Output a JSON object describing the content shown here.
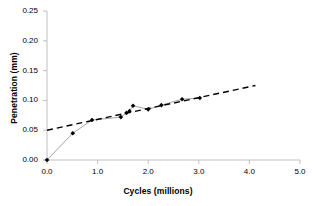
{
  "chart_data": {
    "type": "scatter",
    "title": "",
    "xlabel": "Cycles (millions)",
    "ylabel": "Penetration (mm)",
    "xlim": [
      0.0,
      5.0
    ],
    "ylim": [
      0.0,
      0.25
    ],
    "xticks": [
      "0.0",
      "1.0",
      "2.0",
      "3.0",
      "4.0",
      "5.0"
    ],
    "xtick_values": [
      0.0,
      1.0,
      2.0,
      3.0,
      4.0,
      5.0
    ],
    "yticks": [
      "0.00",
      "0.05",
      "0.10",
      "0.15",
      "0.20",
      "0.25"
    ],
    "ytick_values": [
      0.0,
      0.05,
      0.1,
      0.15,
      0.2,
      0.25
    ],
    "grid": false,
    "legend": "none",
    "series": [
      {
        "name": "Penetration measurements",
        "style": "markers-with-connecting-line",
        "marker": "filled-diamond",
        "color": "#000000",
        "points": [
          {
            "x": 0.0,
            "y": 0.0
          },
          {
            "x": 0.51,
            "y": 0.045
          },
          {
            "x": 0.89,
            "y": 0.067
          },
          {
            "x": 1.46,
            "y": 0.072
          },
          {
            "x": 1.57,
            "y": 0.079
          },
          {
            "x": 1.63,
            "y": 0.082
          },
          {
            "x": 1.7,
            "y": 0.091
          },
          {
            "x": 2.0,
            "y": 0.085
          },
          {
            "x": 2.26,
            "y": 0.092
          },
          {
            "x": 2.67,
            "y": 0.102
          },
          {
            "x": 3.02,
            "y": 0.104
          }
        ]
      },
      {
        "name": "Linear trend line",
        "style": "dashed-line",
        "color": "#000000",
        "endpoints": [
          {
            "x": 0.0,
            "y": 0.05
          },
          {
            "x": 4.12,
            "y": 0.125
          }
        ]
      }
    ],
    "axis_color": "#BFBFBF"
  }
}
